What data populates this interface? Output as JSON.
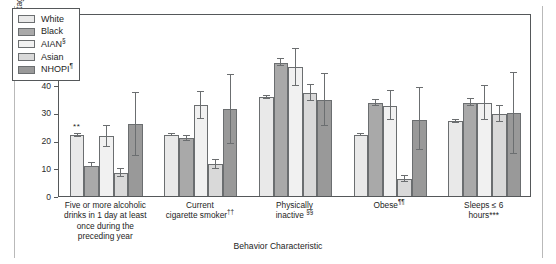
{
  "chart_data": {
    "type": "bar",
    "title": "",
    "xlabel": "Behavior Characteristic",
    "ylabel": "Percentage",
    "ylim": [
      0,
      66
    ],
    "yticks": [
      0,
      10,
      20,
      30,
      40,
      50,
      60
    ],
    "grid": false,
    "legend_position": "top-left",
    "categories": [
      "Five or more alcoholic drinks in 1 day at least once during the preceding year",
      "Current cigarette smoker††",
      "Physically inactive §§",
      "Obese¶¶",
      "Sleeps ≤ 6 hours***"
    ],
    "series": [
      {
        "name": "White",
        "color": "#e9e9e9",
        "values": [
          21.9,
          22.0,
          35.6,
          22.0,
          26.9
        ],
        "ci_low": [
          21.3,
          21.5,
          35.0,
          21.5,
          26.4
        ],
        "ci_high": [
          22.5,
          22.5,
          36.2,
          22.5,
          27.4
        ]
      },
      {
        "name": "Black",
        "color": "#a9a9a9",
        "values": [
          11.0,
          20.8,
          48.0,
          33.5,
          33.7
        ],
        "ci_low": [
          10.3,
          20.0,
          46.9,
          32.4,
          32.4
        ],
        "ci_high": [
          11.8,
          21.6,
          49.3,
          34.7,
          35.0
        ]
      },
      {
        "name": "AIAN§",
        "color": "#f1f1f1",
        "values": [
          21.6,
          32.7,
          46.5,
          32.6,
          33.6
        ],
        "ci_low": [
          17.6,
          27.6,
          39.5,
          27.5,
          27.3
        ],
        "ci_high": [
          25.3,
          37.6,
          53.2,
          37.7,
          39.7
        ]
      },
      {
        "name": "Asian",
        "color": "#d9d9d9",
        "values": [
          8.3,
          11.4,
          37.1,
          6.0,
          29.5
        ],
        "ci_low": [
          6.8,
          9.9,
          34.2,
          5.0,
          26.7
        ],
        "ci_high": [
          9.9,
          13.0,
          40.0,
          7.1,
          32.4
        ]
      },
      {
        "name": "NHOPI¶",
        "color": "#999999",
        "values": [
          25.8,
          31.5,
          34.8,
          27.4,
          29.9
        ],
        "ci_low": [
          14.6,
          18.9,
          25.4,
          16.5,
          15.3
        ],
        "ci_high": [
          37.3,
          43.7,
          44.0,
          38.8,
          44.5
        ]
      }
    ],
    "annotations": [
      {
        "text": "**",
        "category_index": 0,
        "series_index": 0,
        "note": "significance marker above White bar in first group"
      }
    ]
  },
  "legend": {
    "items": [
      {
        "label": "White",
        "sup": ""
      },
      {
        "label": "Black",
        "sup": ""
      },
      {
        "label": "AIAN",
        "sup": "§"
      },
      {
        "label": "Asian",
        "sup": ""
      },
      {
        "label": "NHOPI",
        "sup": "¶"
      }
    ]
  },
  "axes": {
    "y_title": "Percentage",
    "x_title": "Behavior Characteristic",
    "y_tick_labels": [
      "0",
      "10",
      "20",
      "30",
      "40",
      "50",
      "60"
    ]
  },
  "category_labels": [
    {
      "line1": "Five or more alcoholic",
      "line2": "drinks in 1 day at least",
      "line3": "once during the",
      "line4": "preceding year",
      "sup": ""
    },
    {
      "line1": "Current",
      "line2": "cigarette smoker",
      "sup": "††"
    },
    {
      "line1": "Physically",
      "line2": "inactive ",
      "sup": "§§"
    },
    {
      "line1": "Obese",
      "sup": "¶¶"
    },
    {
      "line1": "Sleeps ≤ 6",
      "line2": "hours***",
      "sup": ""
    }
  ]
}
